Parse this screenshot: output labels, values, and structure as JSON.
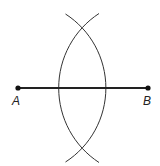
{
  "diagram": {
    "type": "perpendicular-bisector-construction",
    "segment": {
      "from": "A",
      "to": "B"
    },
    "points": [
      {
        "label": "A",
        "x": 18,
        "y": 88
      },
      {
        "label": "B",
        "x": 148,
        "y": 88
      }
    ],
    "arcs": [
      {
        "center": "A",
        "radius": 88,
        "description": "arc centered at A bulging right"
      },
      {
        "center": "B",
        "radius": 89,
        "description": "arc centered at B bulging left"
      }
    ],
    "intersections": [
      {
        "x": 83,
        "y": 29
      },
      {
        "x": 83,
        "y": 147
      }
    ],
    "colors": {
      "line": "#222222",
      "arc": "#333333",
      "background": "#ffffff"
    }
  }
}
